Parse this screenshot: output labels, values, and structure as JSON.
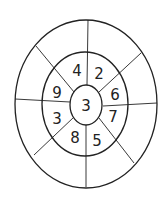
{
  "diagram": {
    "type": "concentric-ring-number-puzzle",
    "center": {
      "value": "3"
    },
    "inner_ring": {
      "cells": [
        {
          "position": "top-left",
          "value": "4"
        },
        {
          "position": "top-right",
          "value": "2"
        },
        {
          "position": "right-upper",
          "value": "6"
        },
        {
          "position": "right-lower",
          "value": "7"
        },
        {
          "position": "bottom-right",
          "value": "5"
        },
        {
          "position": "bottom-left",
          "value": "8"
        },
        {
          "position": "left-lower",
          "value": "3"
        },
        {
          "position": "left-upper",
          "value": "9"
        }
      ]
    },
    "outer_ring": {
      "cells": [
        "",
        "",
        "",
        "",
        "",
        "",
        "",
        ""
      ]
    },
    "stroke_color": "#222222",
    "background": "#ffffff"
  }
}
